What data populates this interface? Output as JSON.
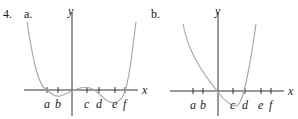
{
  "problem": {
    "number": "4."
  },
  "graphs": [
    {
      "label": "a.",
      "x_axis_label": "x",
      "y_axis_label": "y",
      "ticks": [
        "a",
        "b",
        "c",
        "d",
        "e",
        "f"
      ]
    },
    {
      "label": "b.",
      "x_axis_label": "x",
      "y_axis_label": "y",
      "ticks": [
        "a",
        "b",
        "c",
        "d",
        "e",
        "f"
      ]
    }
  ],
  "colors": {
    "axis": "#333333",
    "curve": "#aaaaaa"
  }
}
